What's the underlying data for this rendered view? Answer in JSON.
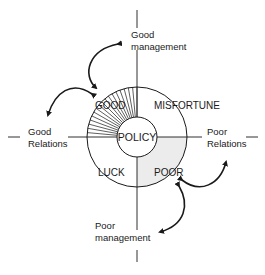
{
  "diagram": {
    "center_label": "POLICY",
    "quadrants": {
      "top_left": "GOOD",
      "top_right": "MISFORTUNE",
      "bottom_left": "LUCK",
      "bottom_right": "POOR"
    },
    "axes": {
      "top": [
        "Good",
        "management"
      ],
      "bottom": [
        "Poor",
        "management"
      ],
      "left": [
        "Good",
        "Relations"
      ],
      "right": [
        "Poor",
        "Relations"
      ]
    },
    "colors": {
      "line": "#1a1a1a",
      "poor_fill": "#ececec",
      "background": "#ffffff"
    }
  }
}
